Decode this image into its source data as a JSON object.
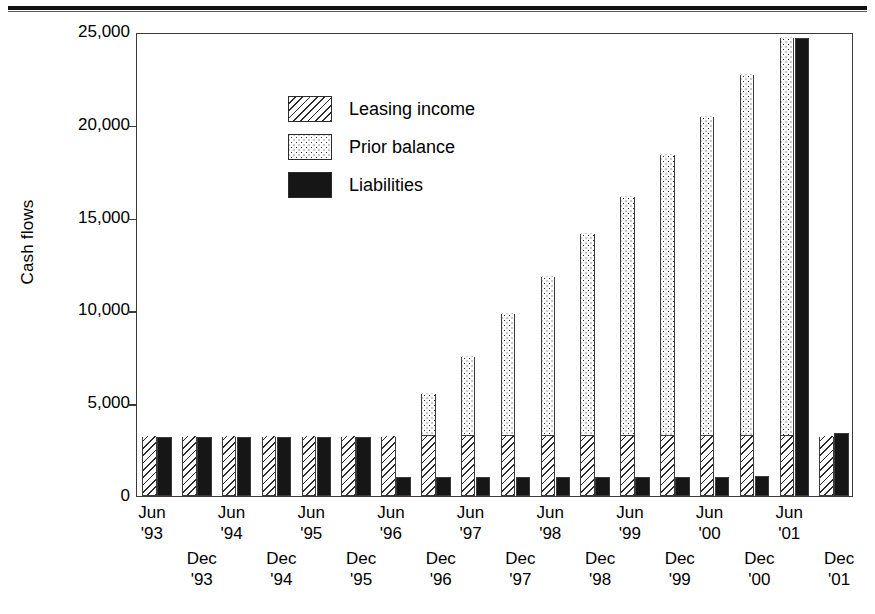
{
  "axis": {
    "y_title": "Cash flows",
    "y_ticks": [
      "25,000",
      "20,000",
      "15,000",
      "10,000",
      "5,000",
      "0"
    ]
  },
  "legend": {
    "items": [
      {
        "label": "Leasing income",
        "pattern": "hatch"
      },
      {
        "label": "Prior balance",
        "pattern": "dots"
      },
      {
        "label": "Liabilities",
        "pattern": "solid"
      }
    ]
  },
  "x_labels": [
    {
      "month": "Jun",
      "year": "'93",
      "row": 0
    },
    {
      "month": "Dec",
      "year": "'93",
      "row": 1
    },
    {
      "month": "Jun",
      "year": "'94",
      "row": 0
    },
    {
      "month": "Dec",
      "year": "'94",
      "row": 1
    },
    {
      "month": "Jun",
      "year": "'95",
      "row": 0
    },
    {
      "month": "Dec",
      "year": "'95",
      "row": 1
    },
    {
      "month": "Jun",
      "year": "'96",
      "row": 0
    },
    {
      "month": "Dec",
      "year": "'96",
      "row": 1
    },
    {
      "month": "Jun",
      "year": "'97",
      "row": 0
    },
    {
      "month": "Dec",
      "year": "'97",
      "row": 1
    },
    {
      "month": "Jun",
      "year": "'98",
      "row": 0
    },
    {
      "month": "Dec",
      "year": "'98",
      "row": 1
    },
    {
      "month": "Jun",
      "year": "'99",
      "row": 0
    },
    {
      "month": "Dec",
      "year": "'99",
      "row": 1
    },
    {
      "month": "Jun",
      "year": "'00",
      "row": 0
    },
    {
      "month": "Dec",
      "year": "'00",
      "row": 1
    },
    {
      "month": "Jun",
      "year": "'01",
      "row": 0
    },
    {
      "month": "Dec",
      "year": "'01",
      "row": 1
    }
  ],
  "chart_data": {
    "type": "bar",
    "title": "",
    "xlabel": "",
    "ylabel": "Cash flows",
    "ylim": [
      0,
      25000
    ],
    "ytick_interval": 5000,
    "grid": false,
    "legend_position": "inside-top-left",
    "bar_mode": "paired-stacked",
    "categories": [
      "Jun '93",
      "Dec '93",
      "Jun '94",
      "Dec '94",
      "Jun '95",
      "Dec '95",
      "Jun '96",
      "Dec '96",
      "Jun '97",
      "Dec '97",
      "Jun '98",
      "Dec '98",
      "Jun '99",
      "Dec '99",
      "Jun '00",
      "Dec '00",
      "Jun '01",
      "Dec '01"
    ],
    "series": [
      {
        "name": "Leasing income",
        "pattern": "hatch",
        "values": [
          3200,
          3200,
          3200,
          3200,
          3200,
          3200,
          3200,
          3200,
          3200,
          3200,
          3200,
          3200,
          3200,
          3200,
          3200,
          3200,
          3200,
          3200
        ]
      },
      {
        "name": "Prior balance",
        "pattern": "dots",
        "values": [
          0,
          0,
          0,
          0,
          0,
          0,
          0,
          2300,
          4300,
          6600,
          8600,
          10900,
          12900,
          15200,
          17200,
          19500,
          21500,
          0
        ]
      },
      {
        "name": "Liabilities",
        "pattern": "solid",
        "values": [
          3200,
          3200,
          3200,
          3200,
          3200,
          3200,
          1000,
          1000,
          1000,
          1000,
          1000,
          1000,
          1050,
          1050,
          1050,
          1100,
          24700,
          3400
        ]
      }
    ],
    "stack_totals_left_bar": [
      3200,
      3200,
      3200,
      3200,
      3200,
      3200,
      3200,
      5500,
      7500,
      9800,
      11800,
      14100,
      16100,
      18400,
      20400,
      22700,
      24700,
      3200
    ]
  },
  "colors": {
    "ink": "#161616",
    "frame": "#3b3b3b",
    "paper": "#ffffff"
  }
}
